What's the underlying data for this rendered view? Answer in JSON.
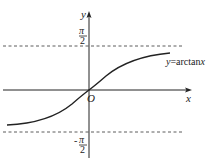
{
  "diagram": {
    "axes": {
      "x_label": "x",
      "y_label": "y",
      "origin_label": "O"
    },
    "asymptotes": {
      "upper": {
        "num": "π",
        "den": "2",
        "sign": ""
      },
      "lower": {
        "num": "π",
        "den": "2",
        "sign": "-"
      }
    },
    "curve": {
      "function": "arctan",
      "label": "y=arctanx",
      "label_prefix": "y",
      "label_eq": "=arctan",
      "label_var": "x"
    },
    "colors": {
      "stroke": "#222222",
      "background": "#ffffff"
    }
  }
}
